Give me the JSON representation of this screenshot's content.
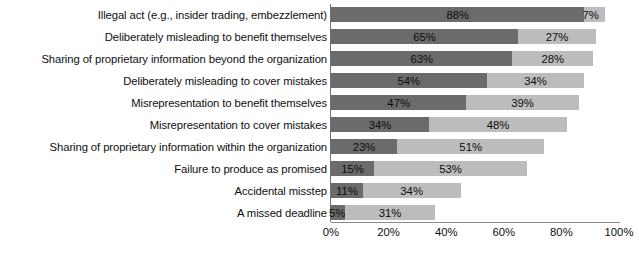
{
  "chart_data": {
    "type": "bar",
    "orientation": "horizontal",
    "stacked": true,
    "title": "",
    "subtitle": "",
    "xlabel": "",
    "ylabel": "",
    "xlim": [
      0,
      100
    ],
    "xticks": [
      "0%",
      "20%",
      "40%",
      "60%",
      "80%",
      "100%"
    ],
    "xtick_values": [
      0,
      20,
      40,
      60,
      80,
      100
    ],
    "grid": false,
    "legend": "none",
    "categories": [
      "Illegal act (e.g., insider trading, embezzlement)",
      "Deliberately misleading to benefit themselves",
      "Sharing of proprietary information beyond the organization",
      "Deliberately misleading to cover mistakes",
      "Misrepresentation to benefit themselves",
      "Misrepresentation to cover mistakes",
      "Sharing of proprietary information within the organization",
      "Failure to produce as promised",
      "Accidental misstep",
      "A missed deadline"
    ],
    "series": [
      {
        "name": "series-1",
        "color": "#6b6b6b",
        "values": [
          88,
          65,
          63,
          54,
          47,
          34,
          23,
          15,
          11,
          5
        ],
        "labels": [
          "88%",
          "65%",
          "63%",
          "54%",
          "47%",
          "34%",
          "23%",
          "15%",
          "11%",
          "5%"
        ]
      },
      {
        "name": "series-2",
        "color": "#bcbcbc",
        "values": [
          7,
          27,
          28,
          34,
          39,
          48,
          51,
          53,
          34,
          31
        ],
        "labels": [
          "7%",
          "27%",
          "28%",
          "34%",
          "39%",
          "48%",
          "51%",
          "53%",
          "34%",
          "31%"
        ]
      }
    ]
  }
}
